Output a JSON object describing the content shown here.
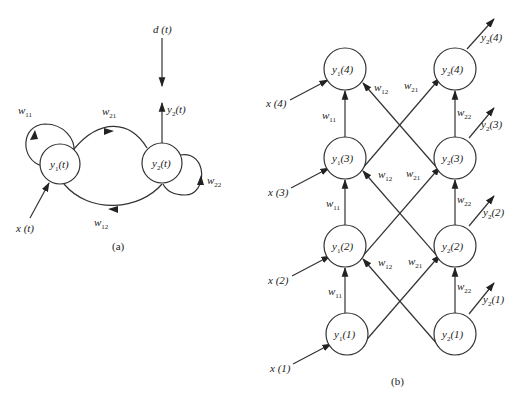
{
  "panel_a": {
    "caption": "(a)",
    "nodes": {
      "y1": {
        "base": "y",
        "sub": "1",
        "arg": "(t)"
      },
      "y2": {
        "base": "y",
        "sub": "2",
        "arg": "(t)"
      }
    },
    "weights": {
      "w11": {
        "base": "w",
        "sub": "11"
      },
      "w21": {
        "base": "w",
        "sub": "21"
      },
      "w12": {
        "base": "w",
        "sub": "12"
      },
      "w22": {
        "base": "w",
        "sub": "22"
      }
    },
    "input": "x (t)",
    "desired": "d (t)",
    "output": {
      "base": "y",
      "sub": "2",
      "arg": "(t)"
    }
  },
  "panel_b": {
    "caption": "(b)",
    "layers": [
      {
        "t": "4",
        "y1": "(4)",
        "y2": "(4)",
        "x": "x (4)",
        "out": "(4)"
      },
      {
        "t": "3",
        "y1": "(3)",
        "y2": "(3)",
        "x": "x (3)",
        "out": "(3)"
      },
      {
        "t": "2",
        "y1": "(2)",
        "y2": "(2)",
        "x": "x (2)",
        "out": "(2)"
      },
      {
        "t": "1",
        "y1": "(1)",
        "y2": "(1)",
        "x": "x (1)",
        "out": "(1)"
      }
    ],
    "weights": {
      "w11": "11",
      "w12": "12",
      "w21": "21",
      "w22": "22"
    }
  },
  "symbols": {
    "y": "y",
    "w": "w",
    "sub1": "1",
    "sub2": "2"
  }
}
